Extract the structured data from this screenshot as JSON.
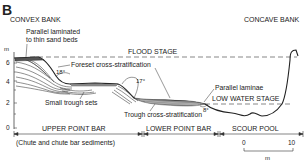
{
  "figure": {
    "panel_letter": "B",
    "left_bank": "CONVEX BANK",
    "right_bank": "CONCAVE BANK"
  },
  "stages": {
    "flood": "FLOOD STAGE",
    "low_water": "LOW WATER STAGE"
  },
  "annotations": {
    "parallel_laminated_line1": "Parallel laminated",
    "parallel_laminated_line2": "to thin sand beds",
    "foreset": "Foreset cross-stratification",
    "small_trough": "Small trough sets",
    "parallel_laminae": "Parallel laminae",
    "trough": "Trough cross-stratification"
  },
  "angles": {
    "a1": "18°",
    "a2": "17°",
    "a3": "8°"
  },
  "y_axis": {
    "unit": "m",
    "ticks": [
      "6",
      "4",
      "2",
      "0"
    ]
  },
  "zones": {
    "upper": "UPPER POINT BAR",
    "upper_note": "(Chute and chute bar sediments)",
    "lower": "LOWER POINT BAR",
    "scour": "SCOUR POOL"
  },
  "scale_bar": {
    "start": "0",
    "end": "10",
    "unit": "m"
  }
}
